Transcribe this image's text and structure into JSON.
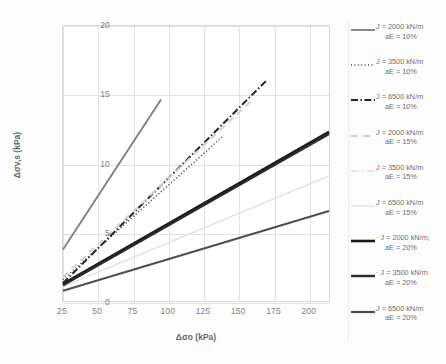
{
  "chart_data": {
    "type": "line",
    "title": "",
    "xlabel": "Δσo (kPa)",
    "ylabel": "Δσv,s (kPa)",
    "xlim": [
      25,
      215
    ],
    "ylim": [
      0,
      20
    ],
    "xticks": [
      25,
      50,
      75,
      100,
      125,
      150,
      175,
      200
    ],
    "yticks": [
      0,
      5,
      10,
      15,
      20
    ],
    "grid": true,
    "legend_position": "right",
    "series": [
      {
        "name": "J = 2000 kN/m aE = 10%",
        "label_line1": "J = 2000 kN/m",
        "label_line2": "aE = 10%",
        "style": "solid",
        "color": "#808080",
        "width": 1.9,
        "x": [
          25,
          95
        ],
        "y": [
          3.75,
          14.65
        ]
      },
      {
        "name": "J = 3500 kN/m aE = 10%",
        "label_line1": "J = 3500 kN/m",
        "label_line2": "aE = 10%",
        "style": "dotted",
        "color": "#4a4a4a",
        "width": 1.7,
        "x": [
          25,
          140
        ],
        "y": [
          1.55,
          12.05
        ]
      },
      {
        "name": "J = 6500 kN/m aE = 10%",
        "label_line1": "J = 6500 kN/m",
        "label_line2": "aE = 10%",
        "style": "dashdot",
        "color": "#262626",
        "width": 2.0,
        "x": [
          25,
          170
        ],
        "y": [
          1.3,
          16.0
        ]
      },
      {
        "name": "J = 2000 kN/m aE = 15%",
        "label_line1": "J = 2000 kN/m",
        "label_line2": "aE = 15%",
        "style": "dashed-light",
        "color": "#d2d2d2",
        "width": 2.0,
        "x": [
          25,
          160
        ],
        "y": [
          1.75,
          14.6
        ]
      },
      {
        "name": "J = 3500 kN/m aE = 15%",
        "label_line1": "J = 3500 kN/m",
        "label_line2": "aE = 15%",
        "style": "dashdot-light",
        "color": "#dcdcdc",
        "width": 1.5,
        "x": [
          25,
          215
        ],
        "y": [
          1.2,
          12.4
        ]
      },
      {
        "name": "J = 6500 kN/m aE = 15%",
        "label_line1": "J = 6500 kN/m",
        "label_line2": "aE = 15%",
        "style": "solid-light",
        "color": "#e0e0e0",
        "width": 1.3,
        "x": [
          25,
          215
        ],
        "y": [
          1.05,
          9.1
        ]
      },
      {
        "name": "J = 2000 kN/m, aE = 20%",
        "label_line1": "· J = 2000 kN/m,",
        "label_line2": "aE = 20%",
        "style": "thick-solid",
        "color": "#1a1a1a",
        "width": 2.6,
        "x": [
          25,
          215
        ],
        "y": [
          1.25,
          12.3
        ]
      },
      {
        "name": "J = 3500 kN/m aE = 20%",
        "label_line1": "· J = 3500 kN/m",
        "label_line2": "aE = 20%",
        "style": "thick-solid-2",
        "color": "#2b2b2b",
        "width": 2.4,
        "x": [
          25,
          215
        ],
        "y": [
          1.15,
          12.15
        ]
      },
      {
        "name": "J = 6500 kN/m aE = 20%",
        "label_line1": "J = 6500 kN/m",
        "label_line2": "aE =  20%",
        "style": "thick-solid-3",
        "color": "#4f4f4f",
        "width": 2.2,
        "x": [
          25,
          215
        ],
        "y": [
          0.75,
          6.55
        ]
      }
    ]
  },
  "axes": {
    "x_title": "Δσo (kPa)",
    "y_title": "Δσv,s (kPa)",
    "xticks": [
      "25",
      "50",
      "75",
      "100",
      "125",
      "150",
      "175",
      "200"
    ],
    "yticks": [
      "20",
      "15",
      "10",
      "5",
      "0"
    ]
  }
}
